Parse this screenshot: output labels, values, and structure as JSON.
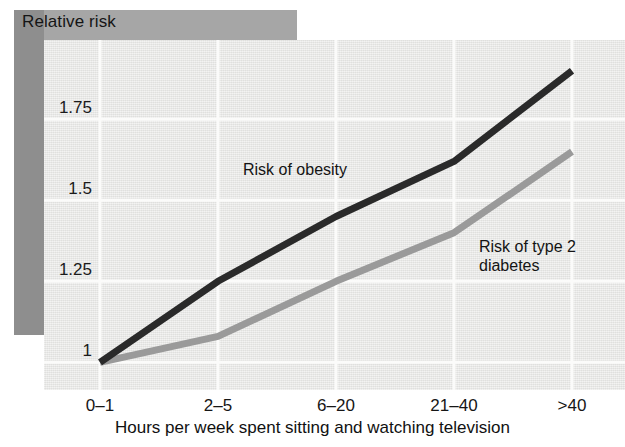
{
  "figure": {
    "title": "Relative risk",
    "colors": {
      "panel_background": "#e9e9e7",
      "title_band": "#a6a6a6",
      "side_band": "#8e8e8e",
      "gridline": "#fbfbfa",
      "obesity_line": "#2a2a2a",
      "diabetes_line": "#9a9a9a"
    }
  },
  "labels": {
    "obesity": "Risk of obesity",
    "diabetes": "Risk of type 2\ndiabetes"
  },
  "chart_data": {
    "type": "line",
    "title": "Relative risk",
    "xlabel": "Hours per week spent sitting and watching television",
    "ylabel": "Relative risk",
    "categories": [
      "0–1",
      "2–5",
      "6–20",
      "21–40",
      ">40"
    ],
    "ytick_labels": [
      "1",
      "1.25",
      "1.5",
      "1.75"
    ],
    "ytick_values": [
      1,
      1.25,
      1.5,
      1.75
    ],
    "ylim": [
      0.93,
      1.97
    ],
    "grid": true,
    "legend_position": "inline-annotations",
    "series": [
      {
        "name": "Risk of obesity",
        "color": "#2a2a2a",
        "values": [
          1.0,
          1.25,
          1.45,
          1.62,
          1.9
        ]
      },
      {
        "name": "Risk of type 2 diabetes",
        "color": "#9a9a9a",
        "values": [
          1.0,
          1.08,
          1.25,
          1.4,
          1.65
        ]
      }
    ]
  }
}
